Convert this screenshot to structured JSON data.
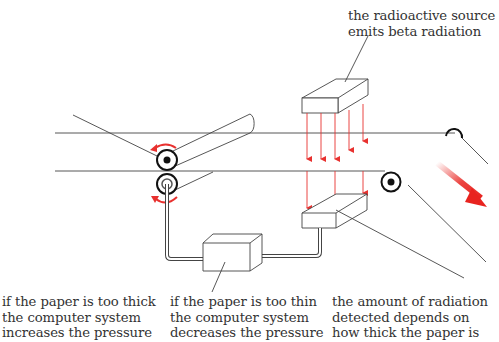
{
  "labels": {
    "source": {
      "line1": "the radioactive source",
      "line2": "emits beta radiation"
    },
    "too_thick": {
      "line1": "if the paper is too thick",
      "line2": "the computer system",
      "line3": "increases the pressure"
    },
    "too_thin": {
      "line1": "if the paper is too thin",
      "line2": "the computer system",
      "line3": "decreases the pressure"
    },
    "detector": {
      "line1": "the amount of radiation",
      "line2": "detected depends on",
      "line3": "how thick the paper is"
    }
  },
  "colors": {
    "line": "#333333",
    "radiation": "#e8312f",
    "arrow": "#e8231f",
    "background": "#ffffff"
  },
  "components": {
    "radioactive_source": "box",
    "detector": "box",
    "computer": "box",
    "rollers": [
      "top-roller",
      "bottom-roller",
      "exit-roller",
      "guide-roller"
    ],
    "radiation_rays": 5
  }
}
